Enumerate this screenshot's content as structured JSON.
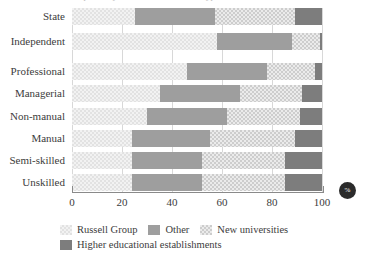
{
  "title_clipped": "Participation by social class and school type",
  "axis": {
    "x_ticks": [
      "0",
      "20",
      "40",
      "60",
      "80",
      "100"
    ],
    "x_tick_values": [
      0,
      20,
      40,
      60,
      80,
      100
    ],
    "unit_badge": "%"
  },
  "legend": {
    "items": [
      {
        "label": "Russell Group",
        "swatch": "light-checker-swatch",
        "color": "#f2f2f2"
      },
      {
        "label": "Other",
        "swatch": "solid-gray-swatch",
        "color": "#9e9e9e"
      },
      {
        "label": "New universities",
        "swatch": "mid-checker-swatch",
        "color": "#ebebeb"
      },
      {
        "label": "Higher educational establishments",
        "swatch": "dark-gray-swatch",
        "color": "#7d7d7d"
      }
    ]
  },
  "chart_data": {
    "type": "bar",
    "orientation": "horizontal",
    "stacked": true,
    "title": "Participation by social class and school type",
    "xlabel": "%",
    "ylabel": "",
    "xlim": [
      0,
      100
    ],
    "grid": true,
    "legend_position": "bottom",
    "categories": [
      "State",
      "Independent",
      "Professional",
      "Managerial",
      "Non-manual",
      "Manual",
      "Semi-skilled",
      "Unskilled"
    ],
    "series": [
      {
        "name": "Russell Group",
        "values": [
          25,
          58,
          46,
          35,
          30,
          24,
          24,
          24
        ]
      },
      {
        "name": "Other",
        "values": [
          32,
          30,
          32,
          32,
          32,
          31,
          28,
          28
        ]
      },
      {
        "name": "New universities",
        "values": [
          32,
          11,
          19,
          25,
          29,
          34,
          33,
          33
        ]
      },
      {
        "name": "Higher educational establishments",
        "values": [
          11,
          1,
          3,
          8,
          9,
          11,
          15,
          15
        ]
      }
    ]
  }
}
